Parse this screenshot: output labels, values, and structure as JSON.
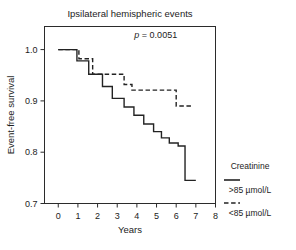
{
  "chart_data": {
    "type": "line",
    "title": "Ipsilateral hemispheric events",
    "xlabel": "Years",
    "ylabel": "Event-free survival",
    "xlim": [
      -0.7,
      8.0
    ],
    "ylim": [
      0.7,
      1.045
    ],
    "xticks": [
      0,
      1,
      2,
      3,
      4,
      5,
      6,
      7,
      8
    ],
    "xtick_labels": [
      "0",
      "1",
      "2",
      "3",
      "4",
      "5",
      "6",
      "7",
      "8"
    ],
    "yticks": [
      0.7,
      0.8,
      0.9,
      1.0
    ],
    "ytick_labels": [
      "0.7",
      "0.8",
      "0.9",
      "1.0"
    ],
    "grid": false,
    "annotation": {
      "symbol": "p",
      "text": " = 0.0051",
      "full": "p = 0.0051",
      "x": 6.05,
      "y": 1.022
    },
    "legend": {
      "position": "right",
      "title": "Creatinine",
      "entries": [
        {
          "label": ">85 µmol/L",
          "style": "solid"
        },
        {
          "label": "<85 µmol/L",
          "style": "dashed"
        }
      ]
    },
    "series": [
      {
        "name": ">85 µmol/L",
        "style": "solid",
        "step": "post",
        "x": [
          0.0,
          0.95,
          0.95,
          1.55,
          1.55,
          2.25,
          2.25,
          2.75,
          2.75,
          3.35,
          3.35,
          3.85,
          3.85,
          4.35,
          4.35,
          4.85,
          4.85,
          5.25,
          5.25,
          5.65,
          5.65,
          6.1,
          6.1,
          6.45,
          6.45,
          7.0
        ],
        "y": [
          1.0,
          1.0,
          0.978,
          0.978,
          0.952,
          0.952,
          0.928,
          0.928,
          0.905,
          0.905,
          0.888,
          0.888,
          0.872,
          0.872,
          0.855,
          0.855,
          0.84,
          0.84,
          0.828,
          0.828,
          0.818,
          0.818,
          0.812,
          0.812,
          0.745,
          0.745
        ]
      },
      {
        "name": "<85 µmol/L",
        "style": "dashed",
        "step": "post",
        "x": [
          0.0,
          1.05,
          1.05,
          1.75,
          1.75,
          2.25,
          2.25,
          3.35,
          3.35,
          3.75,
          3.75,
          6.0,
          6.0,
          6.8
        ],
        "y": [
          1.0,
          1.0,
          0.982,
          0.982,
          0.952,
          0.952,
          0.952,
          0.952,
          0.932,
          0.932,
          0.921,
          0.921,
          0.89,
          0.89
        ]
      }
    ]
  }
}
